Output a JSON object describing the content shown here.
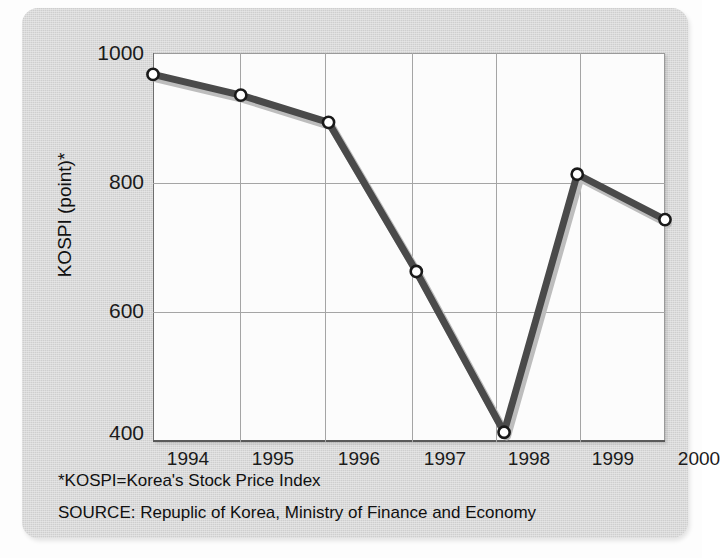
{
  "chart_data": {
    "type": "line",
    "title": "",
    "xlabel": "",
    "ylabel": "KOSPI (point)*",
    "xlim": [
      1993.5,
      2000.5
    ],
    "ylim": [
      400,
      1000
    ],
    "grid": true,
    "legend": "none",
    "x_ticklabels": [
      "1994",
      "1995",
      "1996",
      "1997",
      "1998",
      "1999",
      "2000"
    ],
    "y_ticklabels": [
      "400",
      "600",
      "800",
      "1000"
    ],
    "y_ticks": [
      400,
      600,
      800,
      1000
    ],
    "marker": "open-circle",
    "line_color": "#4a4a4a",
    "marker_fill": "#ffffff",
    "marker_edge": "#1a1a1a",
    "x": [
      1993.5,
      1994.7,
      1995.9,
      1997.1,
      1998.3,
      1999.3,
      2000.5
    ],
    "values": [
      967,
      935,
      893,
      663,
      415,
      813,
      743
    ],
    "points": [
      {
        "x": 1993.5,
        "y": 967
      },
      {
        "x": 1994.7,
        "y": 935
      },
      {
        "x": 1995.9,
        "y": 893
      },
      {
        "x": 1997.1,
        "y": 663
      },
      {
        "x": 1998.3,
        "y": 415
      },
      {
        "x": 1999.3,
        "y": 813
      },
      {
        "x": 2000.5,
        "y": 743
      }
    ],
    "annotations": [
      "*KOSPI=Korea's Stock Price Index",
      "SOURCE: Repuplic of Korea, Ministry of Finance and Economy"
    ]
  },
  "figure": {
    "y_axis_title": "KOSPI (point)*",
    "footnote": "*KOSPI=Korea's Stock Price Index",
    "source": "SOURCE: Repuplic of Korea, Ministry of Finance and Economy"
  },
  "colors": {
    "panel_background": "#d6d6d6",
    "plot_background": "#fcfcfc",
    "gridline": "#a5a5a5",
    "series_line": "#4a4a4a",
    "text": "#101010"
  }
}
